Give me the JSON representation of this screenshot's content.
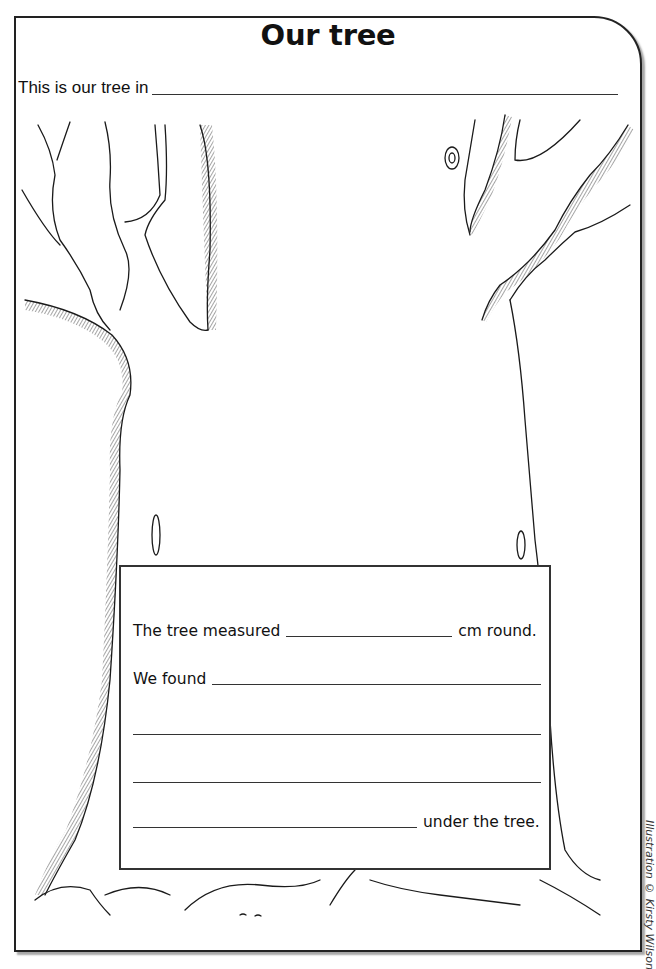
{
  "worksheet": {
    "title": "Our tree",
    "intro_label": "This is our tree in",
    "info_box": {
      "line1_prefix": "The tree measured",
      "line1_suffix": "cm round.",
      "line2_prefix": "We found",
      "line5_suffix": "under the tree."
    },
    "credit": "Illustration © Kirsty Wilson"
  },
  "colors": {
    "ink": "#1a1a1a",
    "frame_border": "#222222",
    "background": "#ffffff"
  },
  "illustration": {
    "subject": "tree-outline",
    "style": "black-and-white line drawing with hatched shading"
  }
}
